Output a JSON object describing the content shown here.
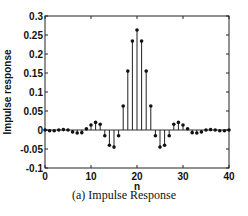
{
  "chart_data": {
    "type": "stem",
    "title": "",
    "caption": "(a) Impulse Response",
    "xlabel": "n",
    "ylabel": "Impulse response",
    "xlim": [
      0,
      40
    ],
    "ylim": [
      -0.1,
      0.3
    ],
    "xticks": [
      0,
      10,
      20,
      30,
      40
    ],
    "yticks": [
      -0.1,
      -0.05,
      0,
      0.05,
      0.1,
      0.15,
      0.2,
      0.25,
      0.3
    ],
    "ytick_labels": [
      "-0.1",
      "-0.05",
      "0",
      "0.05",
      "0.1",
      "0.15",
      "0.2",
      "0.25",
      "0.3"
    ],
    "grid": false,
    "x": [
      0,
      1,
      2,
      3,
      4,
      5,
      6,
      7,
      8,
      9,
      10,
      11,
      12,
      13,
      14,
      15,
      16,
      17,
      18,
      19,
      20,
      21,
      22,
      23,
      24,
      25,
      26,
      27,
      28,
      29,
      30,
      31,
      32,
      33,
      34,
      35,
      36,
      37,
      38,
      39,
      40
    ],
    "values": [
      0,
      -0.002,
      -0.002,
      0,
      0.001,
      0,
      -0.005,
      -0.008,
      -0.007,
      0.003,
      0.013,
      0.02,
      0.015,
      -0.015,
      -0.04,
      -0.045,
      -0.015,
      0.063,
      0.155,
      0.234,
      0.263,
      0.234,
      0.155,
      0.063,
      -0.015,
      -0.045,
      -0.04,
      -0.015,
      0.015,
      0.02,
      0.013,
      0.003,
      -0.007,
      -0.008,
      -0.005,
      0,
      0.001,
      0,
      -0.002,
      -0.002,
      0
    ]
  }
}
